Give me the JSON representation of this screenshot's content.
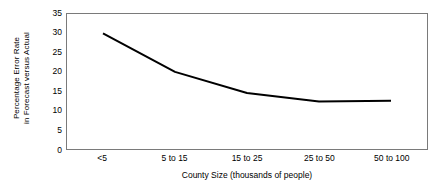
{
  "chart_data": {
    "type": "line",
    "title": "",
    "subtitle": "",
    "xlabel": "County Size (thousands of people)",
    "ylabel": "Percentage Error Rate in Forecast versus Actual",
    "ylabel_line1": "Percentage Error Rate",
    "ylabel_line2": "in Forecast versus Actual",
    "categories": [
      "<5",
      "5 to 15",
      "15 to 25",
      "25 to 50",
      "50 to 100"
    ],
    "values": [
      30,
      20,
      14.5,
      12.3,
      12.5
    ],
    "series": [
      {
        "name": "Percentage Error Rate",
        "values": [
          30,
          20,
          14.5,
          12.3,
          12.5
        ],
        "color": "#000000"
      }
    ],
    "ylim": [
      0,
      35
    ],
    "yticks": [
      0,
      5,
      10,
      15,
      20,
      25,
      30,
      35
    ],
    "ytick_labels": [
      "0",
      "5",
      "10",
      "15",
      "20",
      "25",
      "30",
      "35"
    ],
    "xlim_categories": 5,
    "grid": false,
    "legend": "none",
    "frame": true,
    "line_width": 2,
    "frame_color": "#7a7a7a",
    "background_color": "#ffffff"
  }
}
